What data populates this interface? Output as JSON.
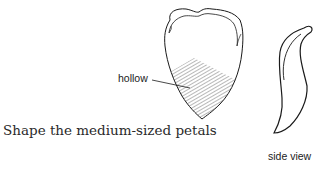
{
  "figure": {
    "caption": "Shape the medium-sized petals",
    "labels": {
      "hollow": "hollow",
      "side_view": "side view"
    },
    "views": [
      {
        "name": "front view",
        "shaded_region": "hollow"
      },
      {
        "name": "side view"
      }
    ],
    "colors": {
      "line": "#1a1a1a",
      "background": "#ffffff"
    }
  }
}
